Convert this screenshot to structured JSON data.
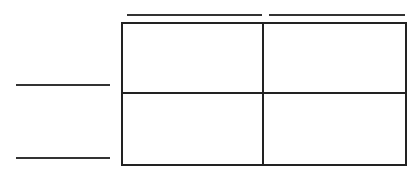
{
  "diagram": {
    "type": "punnett-square",
    "top_labels": [
      "",
      ""
    ],
    "left_labels": [
      "",
      ""
    ],
    "cells": [
      "",
      "",
      "",
      ""
    ],
    "line_color": "#222222"
  }
}
